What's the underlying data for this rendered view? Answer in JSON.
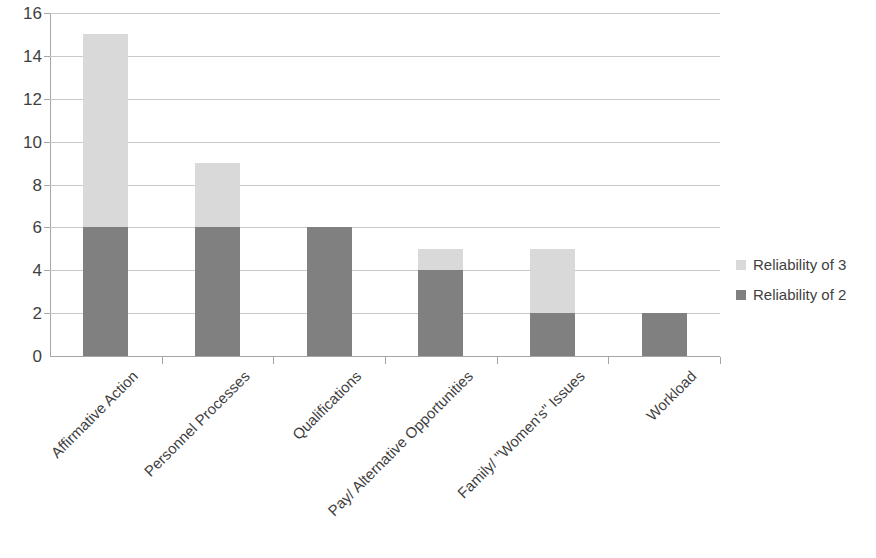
{
  "chart_data": {
    "type": "bar",
    "title": "",
    "subtitle": "",
    "xlabel": "",
    "ylabel": "",
    "stacked": true,
    "grid": true,
    "legend_position": "right",
    "ylim": [
      0,
      16
    ],
    "ytick_step": 2,
    "ytick_labels": [
      "16",
      "14",
      "12",
      "10",
      "8",
      "6",
      "4",
      "2",
      "0"
    ],
    "ytick_values": [
      16,
      14,
      12,
      10,
      8,
      6,
      4,
      2,
      0
    ],
    "categories": [
      "Affirmative Action",
      "Personnel Processes",
      "Qualifications",
      "Pay/ Alternative Opportunities",
      "Family/ \"Women's\" Issues",
      "Workload"
    ],
    "series": [
      {
        "name": "Reliability of 2",
        "color": "#808080",
        "values": [
          6,
          6,
          6,
          4,
          2,
          2
        ]
      },
      {
        "name": "Reliability of 3",
        "color": "#d9d9d9",
        "values": [
          9,
          3,
          0,
          1,
          3,
          0
        ]
      }
    ],
    "totals": [
      15,
      9,
      6,
      5,
      5,
      2
    ]
  },
  "legend": {
    "items": [
      {
        "label": "Reliability of 3",
        "color": "#d9d9d9"
      },
      {
        "label": "Reliability of 2",
        "color": "#808080"
      }
    ]
  },
  "colors": {
    "series_high": "#d9d9d9",
    "series_low": "#808080",
    "gridline": "#c9c9c9",
    "axis": "#a6a6a6",
    "text": "#3f3f3f",
    "background": "#ffffff"
  }
}
